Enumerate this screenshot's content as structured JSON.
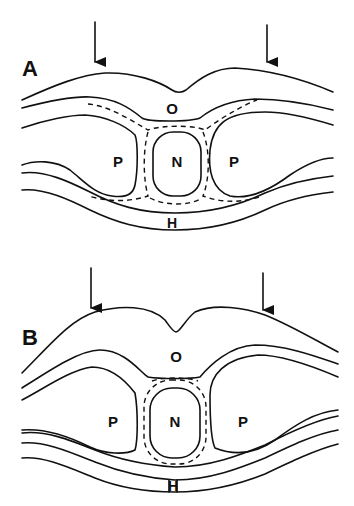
{
  "figure": {
    "panels": [
      {
        "id": "A",
        "label": "A",
        "regions": {
          "top": "O",
          "left": "P",
          "center": "N",
          "right": "P",
          "bottom": "H"
        },
        "arrows": 2
      },
      {
        "id": "B",
        "label": "B",
        "regions": {
          "top": "O",
          "left": "P",
          "center": "N",
          "right": "P",
          "bottom": "H"
        },
        "arrows": 2
      }
    ],
    "colors": {
      "line": "#111111",
      "background": "#ffffff"
    }
  }
}
